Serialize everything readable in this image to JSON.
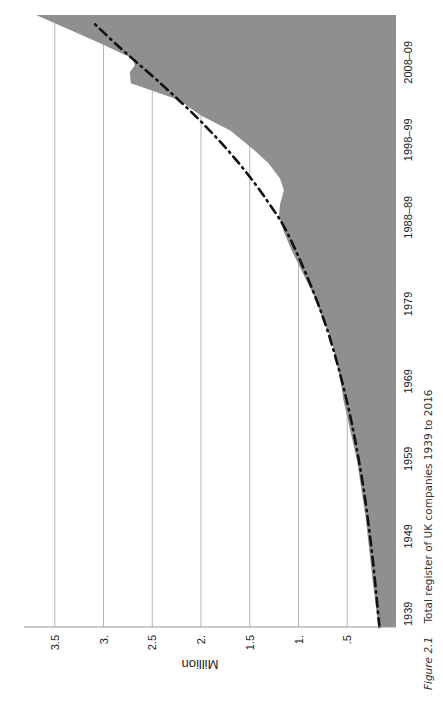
{
  "chart_data": {
    "type": "area",
    "orientation": "rotated 90° counter-clockwise (time runs bottom to top)",
    "title": "",
    "caption": {
      "figure_label": "Figure 2.1",
      "text": "Total register of UK companies 1939 to 2016"
    },
    "xlabel": "",
    "ylabel": "Million",
    "x_tick_labels": [
      "1939",
      "1949",
      "1959",
      "1969",
      "1979",
      "1988–89",
      "1998–99",
      "2008–09"
    ],
    "x_tick_years": [
      1939,
      1949,
      1959,
      1969,
      1979,
      1989,
      1999,
      2009
    ],
    "y_tick_labels": [
      ".5",
      "1.",
      "1.5",
      "2.",
      "2.5",
      "3.",
      "3.5"
    ],
    "y_tick_values": [
      0.5,
      1.0,
      1.5,
      2.0,
      2.5,
      3.0,
      3.5
    ],
    "xlim": [
      1939,
      2018
    ],
    "ylim": [
      0,
      3.95
    ],
    "grid": "horizontal value gridlines",
    "series": [
      {
        "name": "Total register",
        "style": "filled area",
        "color": "#8f8f8f",
        "x": [
          1939,
          1945,
          1953,
          1960.5,
          1964.4,
          1968.3,
          1970.9,
          1976,
          1982,
          1985.3,
          1987.6,
          1990,
          1992.2,
          1993.5,
          1995.4,
          1996.9,
          1998.9,
          2000.5,
          2003.1,
          2005.1,
          2007,
          2008.3,
          2009.2,
          2010.6,
          2011.5,
          2012.4,
          2014.4,
          2018
        ],
        "values": [
          0.18,
          0.24,
          0.31,
          0.4,
          0.47,
          0.54,
          0.57,
          0.66,
          0.85,
          0.98,
          1.07,
          1.15,
          1.2,
          1.19,
          1.15,
          1.19,
          1.31,
          1.45,
          1.7,
          2.01,
          2.22,
          2.52,
          2.72,
          2.73,
          2.68,
          2.7,
          3.04,
          3.69
        ]
      },
      {
        "name": "Trend",
        "style": "dash-dot line",
        "color": "#111111",
        "x": [
          1939,
          1949,
          1959,
          1969,
          1979,
          1989,
          1994,
          1999,
          2004,
          2009,
          2014,
          2017.2
        ],
        "values": [
          0.17,
          0.25,
          0.36,
          0.52,
          0.75,
          1.08,
          1.32,
          1.62,
          1.98,
          2.4,
          2.85,
          3.12
        ]
      }
    ]
  }
}
